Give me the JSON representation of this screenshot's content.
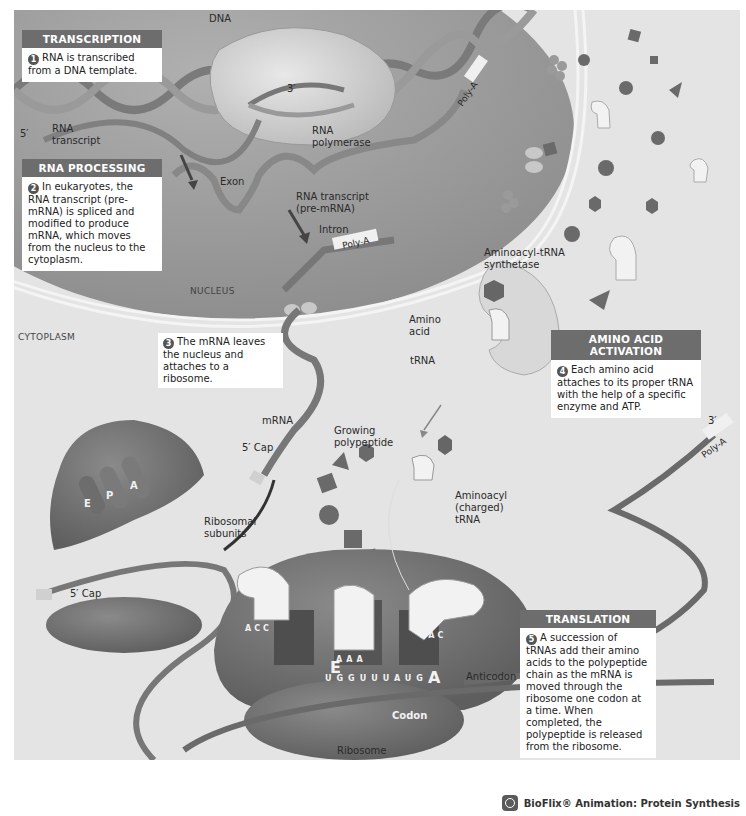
{
  "diagram": {
    "regions": {
      "nucleus": "NUCLEUS",
      "cytoplasm": "CYTOPLASM"
    },
    "steps": [
      {
        "number": "1",
        "heading": "TRANSCRIPTION",
        "text": "RNA is transcribed from a DNA template."
      },
      {
        "number": "2",
        "heading": "RNA PROCESSING",
        "text": "In eukaryotes, the RNA transcript (pre-mRNA) is spliced and modified to produce mRNA, which moves from the nucleus to the cytoplasm."
      },
      {
        "number": "3",
        "heading": "",
        "text": "The mRNA leaves the nucleus and attaches to a ribosome."
      },
      {
        "number": "4",
        "heading": "AMINO ACID ACTIVATION",
        "text": "Each amino acid attaches to its proper tRNA with the help of a specific enzyme and ATP."
      },
      {
        "number": "5",
        "heading": "TRANSLATION",
        "text": "A succession of tRNAs add their amino acids to the polypeptide chain as the mRNA is moved through the ribosome one codon at a time. When completed, the polypeptide is released from the ribosome."
      }
    ],
    "labels": {
      "dna": "DNA",
      "three_prime_top": "3′",
      "five_prime": "5′",
      "rna_transcript": "RNA\ntranscript",
      "rna_polymerase": "RNA\npolymerase",
      "poly_a_1": "Poly-A",
      "exon": "Exon",
      "rna_transcript_pre": "RNA transcript\n(pre-mRNA)",
      "intron": "Intron",
      "poly_a_2": "Poly-A",
      "synthetase": "Aminoacyl-tRNA\nsynthetase",
      "amino_acid": "Amino\nacid",
      "trna": "tRNA",
      "mrna": "mRNA",
      "five_cap_1": "5′ Cap",
      "growing_polypeptide": "Growing\npolypeptide",
      "aminoacyl_trna": "Aminoacyl\n(charged)\ntRNA",
      "site_e": "E",
      "site_p": "P",
      "site_a": "A",
      "ribosomal_subunits": "Ribosomal\nsubunits",
      "five_cap_2": "5′ Cap",
      "three_prime_right": "3′",
      "poly_a_3": "Poly-A",
      "ribosome_e": "E",
      "ribosome_a": "A",
      "anticodon": "Anticodon",
      "codon": "Codon",
      "ribosome": "Ribosome"
    },
    "anticodons": {
      "e_site": [
        "A",
        "C",
        "C"
      ],
      "p_site": [
        "A",
        "A",
        "A"
      ],
      "a_site": [
        "U",
        "A",
        "C"
      ]
    },
    "mrna_sequence": [
      "U",
      "G",
      "G",
      "U",
      "U",
      "U",
      "A",
      "U",
      "G"
    ],
    "footer": {
      "icon": "bioflix-icon",
      "text": "BioFlix® Animation: Protein Synthesis"
    }
  }
}
